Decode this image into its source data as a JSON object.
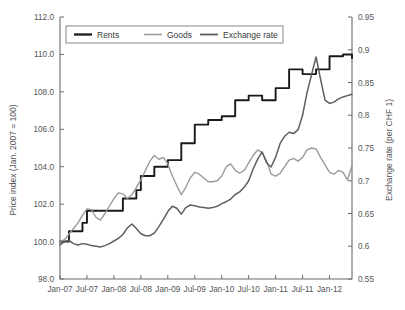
{
  "chart_data": {
    "type": "line",
    "title": "",
    "xlabel": "",
    "ylabel": "Price index (Jan. 2007 = 100)",
    "y2label": "Exchange rate (per CHF 1)",
    "ylim": [
      98.0,
      112.0
    ],
    "y2lim": [
      0.55,
      0.95
    ],
    "yticks": [
      "98.0",
      "100.0",
      "102.0",
      "104.0",
      "106.0",
      "108.0",
      "110.0",
      "112.0"
    ],
    "ytick_values": [
      98.0,
      100.0,
      102.0,
      104.0,
      106.0,
      108.0,
      110.0,
      112.0
    ],
    "y2ticks": [
      "0.55",
      "0.6",
      "0.65",
      "0.7",
      "0.75",
      "0.8",
      "0.85",
      "0.9",
      "0.95"
    ],
    "y2tick_values": [
      0.55,
      0.6,
      0.65,
      0.7,
      0.75,
      0.8,
      0.85,
      0.9,
      0.95
    ],
    "xticks": [
      "Jan-07",
      "Jul-07",
      "Jan-08",
      "Jul-08",
      "Jan-09",
      "Jul-09",
      "Jan-10",
      "Jul-10",
      "Jan-11",
      "Jul-11",
      "Jan-12"
    ],
    "xtick_indices": [
      0,
      6,
      12,
      18,
      24,
      30,
      36,
      42,
      48,
      54,
      60
    ],
    "x_count": 66,
    "grid": false,
    "legend_position": "top-center",
    "legend": [
      "Rents",
      "Goods",
      "Exchange rate"
    ],
    "colors": {
      "rents": "#1a1a1a",
      "goods": "#9a9a9a",
      "exchange_rate": "#5e5e5e"
    },
    "series": [
      {
        "name": "Rents",
        "axis": "left",
        "color": "#1a1a1a",
        "values": [
          100.0,
          100.0,
          100.55,
          100.55,
          100.55,
          101.0,
          101.65,
          101.65,
          101.65,
          101.65,
          101.65,
          101.65,
          101.65,
          101.65,
          102.3,
          102.3,
          102.3,
          102.75,
          103.5,
          103.5,
          103.5,
          104.0,
          104.0,
          104.0,
          104.35,
          104.35,
          104.35,
          105.25,
          105.25,
          105.25,
          106.25,
          106.25,
          106.25,
          106.5,
          106.5,
          106.5,
          106.7,
          106.7,
          106.7,
          107.55,
          107.55,
          107.55,
          107.8,
          107.8,
          107.8,
          107.55,
          107.55,
          107.55,
          108.2,
          108.2,
          108.2,
          109.2,
          109.2,
          109.2,
          108.95,
          108.95,
          108.95,
          109.2,
          109.2,
          109.2,
          109.9,
          109.9,
          109.9,
          110.0,
          110.0,
          109.8
        ]
      },
      {
        "name": "Goods",
        "axis": "left",
        "color": "#9a9a9a",
        "values": [
          100.0,
          100.1,
          100.4,
          100.7,
          101.0,
          101.4,
          101.75,
          101.7,
          101.3,
          101.15,
          101.5,
          101.9,
          102.3,
          102.6,
          102.55,
          102.3,
          102.5,
          102.9,
          103.3,
          103.8,
          104.3,
          104.6,
          104.4,
          104.5,
          104.15,
          103.5,
          103.0,
          102.5,
          102.9,
          103.4,
          103.7,
          103.6,
          103.4,
          103.2,
          103.2,
          103.25,
          103.5,
          104.0,
          104.15,
          103.8,
          103.65,
          103.8,
          104.2,
          104.6,
          104.9,
          104.75,
          104.3,
          103.6,
          103.5,
          103.65,
          104.0,
          104.35,
          104.45,
          104.3,
          104.5,
          104.9,
          105.0,
          104.95,
          104.5,
          104.1,
          103.7,
          103.6,
          103.8,
          103.7,
          103.3,
          104.05
        ]
      },
      {
        "name": "Exchange rate",
        "axis": "right",
        "color": "#5e5e5e",
        "values": [
          0.602,
          0.607,
          0.609,
          0.604,
          0.602,
          0.604,
          0.603,
          0.601,
          0.6,
          0.599,
          0.601,
          0.604,
          0.608,
          0.612,
          0.618,
          0.628,
          0.634,
          0.627,
          0.619,
          0.616,
          0.616,
          0.62,
          0.63,
          0.641,
          0.653,
          0.661,
          0.658,
          0.649,
          0.659,
          0.663,
          0.662,
          0.66,
          0.659,
          0.658,
          0.659,
          0.661,
          0.665,
          0.668,
          0.672,
          0.679,
          0.683,
          0.69,
          0.7,
          0.718,
          0.733,
          0.744,
          0.727,
          0.721,
          0.736,
          0.757,
          0.768,
          0.774,
          0.772,
          0.778,
          0.8,
          0.835,
          0.862,
          0.889,
          0.855,
          0.823,
          0.818,
          0.82,
          0.825,
          0.828,
          0.83,
          0.832
        ]
      }
    ]
  },
  "axes": {
    "left_title": "Price index (Jan. 2007 = 100)",
    "right_title": "Exchange rate (per CHF 1)"
  },
  "legend": {
    "items": [
      {
        "label": "Rents",
        "color": "#1a1a1a",
        "width": 2.3
      },
      {
        "label": "Goods",
        "color": "#9a9a9a",
        "width": 1.6
      },
      {
        "label": "Exchange rate",
        "color": "#5e5e5e",
        "width": 1.8
      }
    ]
  }
}
